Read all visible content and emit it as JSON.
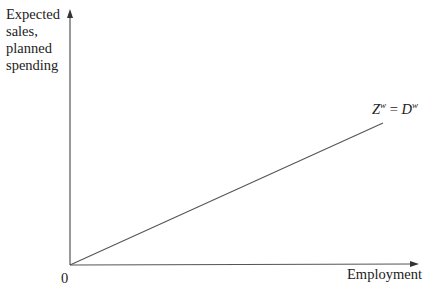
{
  "diagram": {
    "y_axis_label": [
      "Expected",
      "sales,",
      "planned",
      "spending"
    ],
    "x_axis_label": "Employment",
    "origin_label": "0",
    "curve_label": {
      "left": "Z",
      "left_sup": "w",
      "equals": " = ",
      "right": "D",
      "right_sup": "w"
    },
    "colors": {
      "axis": "#555555",
      "line": "#555555",
      "text": "#222222"
    }
  }
}
